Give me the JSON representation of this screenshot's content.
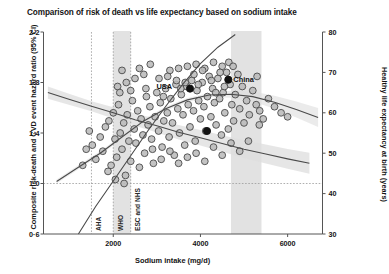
{
  "chart_data": {
    "type": "scatter",
    "title": "Comparison of risk of death vs life expectancy based on sodium intake",
    "xlabel": "Sodium intake (mg/d)",
    "ylabel_left": "Composite risk-death and CVD event hazard ratio (95% CI)",
    "ylabel_right": "Healthy life expectancy at birth (years)",
    "xlim": [
      400,
      6800
    ],
    "xticks": [
      2000,
      4000,
      6000
    ],
    "ylim_left": [
      0.6,
      2.2
    ],
    "yticks_left": [
      "2·2",
      "1·8",
      "1·4",
      "1·0",
      "0·6"
    ],
    "yticks_left_values": [
      2.2,
      1.8,
      1.4,
      1.0,
      0.6
    ],
    "ylim_right": [
      30,
      80
    ],
    "yticks_right": [
      80,
      70,
      60,
      50,
      40,
      30
    ],
    "grid": "dotted reference lines only",
    "legend": "none",
    "reference_hline": {
      "value": 1.0,
      "axis": "left",
      "style": "dotted"
    },
    "guideline_vlines": [
      {
        "label": "AHA",
        "x": 1500
      },
      {
        "label": "WHO",
        "x": 2000
      },
      {
        "label": "ESC and NHS",
        "x": 2400
      }
    ],
    "shaded_bands": [
      {
        "x0": 2000,
        "x1": 2400,
        "note": "WHO to ESC/NHS range"
      },
      {
        "x0": 4700,
        "x1": 5400,
        "note": "observed intake range"
      }
    ],
    "annotations": [
      {
        "label": "USA",
        "x": 3450,
        "y_right": 66.5
      },
      {
        "label": "China",
        "x": 4640,
        "y_right": 68.2,
        "marker": "filled-black"
      }
    ],
    "series": [
      {
        "name": "Composite risk (hazard ratio)",
        "type": "line",
        "axis": "left",
        "points": [
          [
            1200,
            0.6
          ],
          [
            1600,
            0.82
          ],
          [
            2000,
            1.02
          ],
          [
            2400,
            1.22
          ],
          [
            2800,
            1.42
          ],
          [
            3200,
            1.61
          ],
          [
            3600,
            1.79
          ],
          [
            4000,
            1.95
          ],
          [
            4400,
            2.08
          ],
          [
            4800,
            2.18
          ]
        ]
      },
      {
        "name": "Healthy life expectancy trend",
        "type": "line",
        "axis": "right",
        "points": [
          [
            500,
            65.0
          ],
          [
            1000,
            63.3
          ],
          [
            1500,
            61.6
          ],
          [
            2000,
            60.0
          ],
          [
            2500,
            58.3
          ],
          [
            3000,
            56.8
          ],
          [
            3500,
            55.2
          ],
          [
            4000,
            53.8
          ],
          [
            4500,
            52.4
          ],
          [
            5000,
            51.0
          ],
          [
            5500,
            49.8
          ],
          [
            6000,
            48.6
          ],
          [
            6500,
            47.5
          ]
        ]
      },
      {
        "name": "Healthy life expectancy (right axis, fitted curve)",
        "type": "line",
        "axis": "right",
        "points": [
          [
            700,
            43.0
          ],
          [
            1200,
            46.5
          ],
          [
            1700,
            50.0
          ],
          [
            2200,
            54.0
          ],
          [
            2700,
            58.0
          ],
          [
            3200,
            61.0
          ],
          [
            3700,
            63.2
          ],
          [
            4200,
            64.4
          ],
          [
            4700,
            64.6
          ],
          [
            5200,
            64.0
          ],
          [
            5700,
            62.6
          ],
          [
            6200,
            60.8
          ],
          [
            6700,
            58.8
          ]
        ]
      }
    ],
    "scatter": {
      "name": "Countries",
      "marker": "open circle, grey fill",
      "points": [
        [
          1520,
          52.0
        ],
        [
          1600,
          48.5
        ],
        [
          1700,
          54.0
        ],
        [
          1760,
          50.5
        ],
        [
          1820,
          56.5
        ],
        [
          1880,
          45.5
        ],
        [
          1900,
          58.0
        ],
        [
          1950,
          47.0
        ],
        [
          2000,
          60.0
        ],
        [
          2040,
          53.5
        ],
        [
          2080,
          49.0
        ],
        [
          2120,
          62.0
        ],
        [
          2160,
          55.0
        ],
        [
          2200,
          51.0
        ],
        [
          2240,
          57.5
        ],
        [
          2280,
          44.5
        ],
        [
          2320,
          59.5
        ],
        [
          2360,
          53.0
        ],
        [
          2400,
          48.0
        ],
        [
          2440,
          63.0
        ],
        [
          2480,
          56.0
        ],
        [
          2520,
          52.5
        ],
        [
          2560,
          60.5
        ],
        [
          2600,
          46.5
        ],
        [
          2640,
          58.5
        ],
        [
          2680,
          54.5
        ],
        [
          2720,
          50.0
        ],
        [
          2760,
          64.0
        ],
        [
          2800,
          57.0
        ],
        [
          2840,
          61.5
        ],
        [
          2880,
          53.5
        ],
        [
          2920,
          47.5
        ],
        [
          2960,
          59.0
        ],
        [
          3000,
          65.0
        ],
        [
          3040,
          55.5
        ],
        [
          3080,
          62.5
        ],
        [
          3120,
          51.5
        ],
        [
          3160,
          58.0
        ],
        [
          3200,
          66.0
        ],
        [
          3240,
          60.0
        ],
        [
          3280,
          54.0
        ],
        [
          3320,
          63.5
        ],
        [
          3360,
          57.5
        ],
        [
          3400,
          49.5
        ],
        [
          3440,
          67.0
        ],
        [
          3480,
          61.0
        ],
        [
          3520,
          55.0
        ],
        [
          3560,
          64.5
        ],
        [
          3600,
          59.5
        ],
        [
          3640,
          52.0
        ],
        [
          3680,
          66.5
        ],
        [
          3720,
          62.0
        ],
        [
          3760,
          56.5
        ],
        [
          3800,
          68.0
        ],
        [
          3840,
          60.5
        ],
        [
          3880,
          53.0
        ],
        [
          3920,
          65.5
        ],
        [
          3960,
          63.0
        ],
        [
          4000,
          58.5
        ],
        [
          4040,
          67.5
        ],
        [
          4080,
          61.5
        ],
        [
          4120,
          55.5
        ],
        [
          4160,
          64.0
        ],
        [
          4200,
          69.0
        ],
        [
          4240,
          59.0
        ],
        [
          4280,
          66.0
        ],
        [
          4320,
          62.5
        ],
        [
          4360,
          57.0
        ],
        [
          4400,
          68.5
        ],
        [
          4440,
          63.5
        ],
        [
          4480,
          54.5
        ],
        [
          4520,
          65.0
        ],
        [
          4560,
          60.0
        ],
        [
          4600,
          70.0
        ],
        [
          4640,
          56.0
        ],
        [
          4680,
          67.0
        ],
        [
          4720,
          62.0
        ],
        [
          4760,
          58.0
        ],
        [
          4800,
          64.5
        ],
        [
          4860,
          69.5
        ],
        [
          4900,
          61.0
        ],
        [
          4960,
          66.5
        ],
        [
          5000,
          57.5
        ],
        [
          5060,
          63.0
        ],
        [
          5120,
          59.5
        ],
        [
          5200,
          65.5
        ],
        [
          5280,
          62.0
        ],
        [
          5360,
          60.5
        ],
        [
          5440,
          58.5
        ],
        [
          5560,
          63.5
        ],
        [
          5700,
          61.5
        ],
        [
          5850,
          60.0
        ],
        [
          6000,
          59.0
        ],
        [
          1380,
          51.0
        ],
        [
          1300,
          47.0
        ],
        [
          1450,
          55.5
        ],
        [
          2100,
          66.5
        ],
        [
          2300,
          67.5
        ],
        [
          2500,
          68.5
        ],
        [
          2700,
          69.5
        ],
        [
          3300,
          70.5
        ],
        [
          3500,
          71.0
        ],
        [
          3700,
          71.5
        ],
        [
          3900,
          72.0
        ],
        [
          4100,
          71.0
        ],
        [
          4300,
          72.5
        ],
        [
          4500,
          71.5
        ],
        [
          2900,
          51.0
        ],
        [
          3100,
          48.5
        ],
        [
          3300,
          50.5
        ],
        [
          3500,
          47.5
        ],
        [
          3700,
          49.0
        ],
        [
          3900,
          50.0
        ],
        [
          4100,
          48.0
        ],
        [
          4300,
          51.5
        ],
        [
          4500,
          49.5
        ],
        [
          4700,
          52.5
        ],
        [
          4900,
          50.5
        ],
        [
          5100,
          53.0
        ],
        [
          2600,
          71.0
        ],
        [
          2850,
          72.0
        ],
        [
          3050,
          68.5
        ],
        [
          3250,
          69.0
        ],
        [
          3450,
          68.0
        ],
        [
          3650,
          67.5
        ],
        [
          3850,
          69.5
        ],
        [
          4050,
          70.5
        ],
        [
          4250,
          68.0
        ],
        [
          4450,
          70.0
        ],
        [
          4650,
          72.5
        ],
        [
          4750,
          71.5
        ],
        [
          5300,
          69.0
        ],
        [
          5350,
          57.0
        ],
        [
          2200,
          70.5
        ],
        [
          2400,
          65.5
        ],
        [
          2750,
          66.0
        ],
        [
          3150,
          64.0
        ],
        [
          3550,
          66.0
        ],
        [
          3950,
          67.0
        ],
        [
          4350,
          65.0
        ],
        [
          4550,
          66.5
        ],
        [
          2050,
          43.5
        ],
        [
          2250,
          42.5
        ],
        [
          2150,
          65.0
        ]
      ]
    },
    "highlight_points": [
      {
        "label": "China",
        "x": 4640,
        "y_right": 68.2
      },
      {
        "label": "",
        "x": 3760,
        "y_right": 66.0
      },
      {
        "label": "",
        "x": 4150,
        "y_right": 55.5
      }
    ]
  },
  "colors": {
    "axis": "#555555",
    "marker_fill": "#b8b8b8",
    "marker_stroke": "#4a4a4a",
    "curve": "#4a4a4a",
    "band": "#e2e2e2",
    "ci_band": "#dddddd",
    "dotted": "#9a9a9a",
    "highlight": "#111111"
  }
}
